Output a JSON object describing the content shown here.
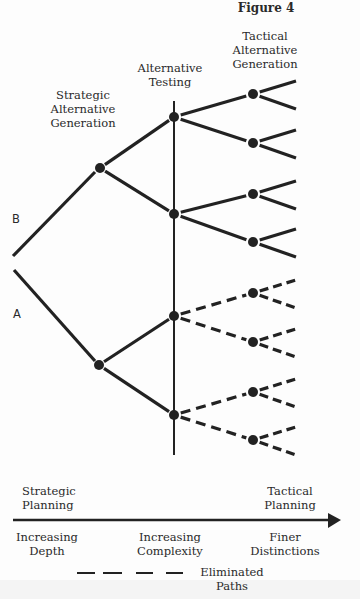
{
  "figure": {
    "title": "Figure 4",
    "colors": {
      "ink": "#222222",
      "label": "#2a2a2a",
      "background": "#fdfdfd"
    }
  },
  "stage_labels": {
    "strategic_generation": [
      "Strategic",
      "Alternative",
      "Generation"
    ],
    "alternative_testing": [
      "Alternative",
      "Testing"
    ],
    "tactical_generation": [
      "Tactical",
      "Alternative",
      "Generation"
    ]
  },
  "branch_labels": {
    "b": "B",
    "a": "A"
  },
  "axis": {
    "left_label": [
      "Strategic",
      "Planning"
    ],
    "right_label": [
      "Tactical",
      "Planning"
    ],
    "below": {
      "left": [
        "Increasing",
        "Depth"
      ],
      "center": [
        "Increasing",
        "Complexity"
      ],
      "right": [
        "Finer",
        "Distinctions"
      ]
    }
  },
  "legend": {
    "label": [
      "Eliminated",
      "Paths"
    ],
    "style": "dashed"
  },
  "tree": {
    "root_lines": [
      {
        "from": [
          13,
          256
        ],
        "to": [
          95,
          172
        ],
        "label": "B"
      },
      {
        "from": [
          14,
          270
        ],
        "to": [
          95,
          361
        ],
        "label": "A"
      }
    ],
    "testing_line": {
      "x": 174,
      "y1": 101,
      "y2": 455
    },
    "strategic_nodes": [
      {
        "id": "B",
        "x": 100,
        "y": 168
      },
      {
        "id": "A",
        "x": 99,
        "y": 365
      }
    ],
    "testing_nodes": [
      {
        "x": 174,
        "y": 117,
        "parent": "B",
        "eliminated": false
      },
      {
        "x": 174,
        "y": 214,
        "parent": "B",
        "eliminated": false
      },
      {
        "x": 174,
        "y": 316,
        "parent": "A",
        "eliminated": true
      },
      {
        "x": 174,
        "y": 415,
        "parent": "A",
        "eliminated": true
      }
    ],
    "tactical_nodes": [
      {
        "x": 253,
        "y": 94,
        "parent": 0,
        "eliminated": false
      },
      {
        "x": 253,
        "y": 143,
        "parent": 0,
        "eliminated": false
      },
      {
        "x": 253,
        "y": 194,
        "parent": 1,
        "eliminated": false
      },
      {
        "x": 253,
        "y": 242,
        "parent": 1,
        "eliminated": false
      },
      {
        "x": 253,
        "y": 293,
        "parent": 2,
        "eliminated": true
      },
      {
        "x": 253,
        "y": 342,
        "parent": 2,
        "eliminated": true
      },
      {
        "x": 253,
        "y": 392,
        "parent": 3,
        "eliminated": true
      },
      {
        "x": 253,
        "y": 440,
        "parent": 3,
        "eliminated": true
      }
    ],
    "leaf_end_x": 296,
    "leaf_up": -13,
    "leaf_down": 15
  }
}
